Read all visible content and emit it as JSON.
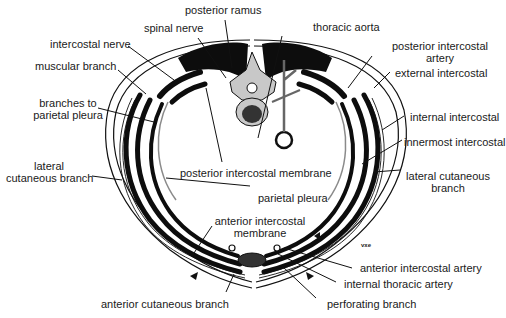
{
  "diagram": {
    "labels": {
      "posterior_ramus": "posterior ramus",
      "spinal_nerve": "spinal nerve",
      "thoracic_aorta": "thoracic aorta",
      "intercostal_nerve": "intercostal nerve",
      "posterior_intercostal_artery_l1": "posterior intercostal",
      "posterior_intercostal_artery_l2": "artery",
      "muscular_branch": "muscular branch",
      "external_intercostal": "external intercostal",
      "branches_parietal_pleura_l1": "branches to",
      "branches_parietal_pleura_l2": "parietal pleura",
      "internal_intercostal": "internal intercostal",
      "innermost_intercostal": "innermost intercostal",
      "lateral_cutaneous_left_l1": "lateral",
      "lateral_cutaneous_left_l2": "cutaneous branch",
      "posterior_intercostal_membrane": "posterior intercostal membrane",
      "lateral_cutaneous_right_l1": "lateral cutaneous",
      "lateral_cutaneous_right_l2": "branch",
      "parietal_pleura": "parietal pleura",
      "anterior_intercostal_membrane_l1": "anterior intercostal",
      "anterior_intercostal_membrane_l2": "membrane",
      "vxe": "vxe",
      "anterior_intercostal_artery": "anterior intercostal artery",
      "internal_thoracic_artery": "internal thoracic artery",
      "anterior_cutaneous_branch": "anterior cutaneous branch",
      "perforating_branch": "perforating branch"
    },
    "colors": {
      "ink": "#111111",
      "muscle": "#0d0d0d",
      "vessel_fill": "#9a9a9a",
      "bone_fill": "#c8c8c8",
      "pleura": "#8a8a8a",
      "background": "#ffffff"
    }
  }
}
